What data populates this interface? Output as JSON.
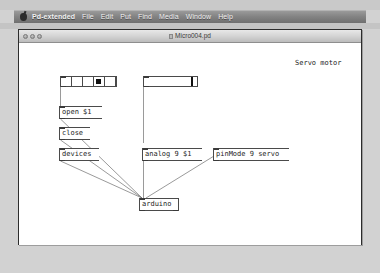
{
  "menubar": {
    "apple_icon": "apple-icon",
    "items": [
      {
        "label": "Pd-extended",
        "bold": true
      },
      {
        "label": "File"
      },
      {
        "label": "Edit"
      },
      {
        "label": "Put"
      },
      {
        "label": "Find"
      },
      {
        "label": "Media"
      },
      {
        "label": "Window"
      },
      {
        "label": "Help"
      }
    ]
  },
  "window": {
    "title": "Micro004.pd",
    "traffic_lights": [
      "close",
      "minimize",
      "zoom"
    ]
  },
  "canvas": {
    "comment": "Servo motor",
    "widgets": {
      "hradio": {
        "name": "hradio",
        "cells": 5,
        "selected_index": 3
      },
      "hslider": {
        "name": "hslider",
        "value_fraction": 0.87
      }
    },
    "messages": [
      {
        "id": "open",
        "text": "open $1"
      },
      {
        "id": "close",
        "text": "close"
      },
      {
        "id": "devices",
        "text": "devices"
      },
      {
        "id": "analog",
        "text": "analog 9 $1"
      },
      {
        "id": "pinmode",
        "text": "pinMode 9 servo"
      }
    ],
    "objects": [
      {
        "id": "arduino",
        "text": "arduino"
      }
    ]
  },
  "colors": {
    "desktop": "#d2d2d2",
    "menubar": "#848484",
    "canvas": "#ffffff",
    "box_border": "#4a4a4a",
    "cord": "#666666",
    "text": "#1c1c1c"
  }
}
